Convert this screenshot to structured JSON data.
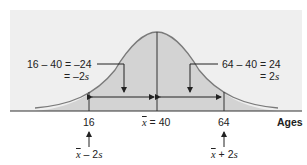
{
  "diagram": {
    "type": "normal-distribution",
    "axis_label": "Ages",
    "mean_value": 40,
    "std_dev": 12,
    "colors": {
      "panel_bg": "#efefef",
      "curve_fill": "#d2d2d2",
      "curve_stroke": "#777777",
      "line": "#333333"
    },
    "ticks": [
      {
        "value": "16",
        "x": 89
      },
      {
        "mean_symbol": "x",
        "eq": " = 40",
        "x": 157
      },
      {
        "value": "64",
        "x": 224
      }
    ],
    "left_annotation": {
      "line1": "16 – 40 = –24",
      "line2": "= –2",
      "var": "s"
    },
    "right_annotation": {
      "line1": "64 – 40 = 24",
      "line2": "= 2",
      "var": "s"
    },
    "bottom_left": {
      "symbol": "x",
      "rest": " – 2",
      "var": "s"
    },
    "bottom_right": {
      "symbol": "x",
      "rest": " + 2",
      "var": "s"
    }
  }
}
